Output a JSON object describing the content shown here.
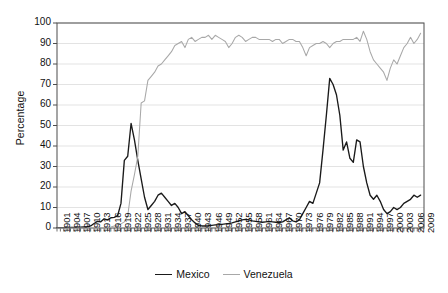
{
  "chart_data": {
    "type": "line",
    "title": "",
    "subtitle": "",
    "xlabel": "",
    "ylabel": "Percentage",
    "xlim": [
      1901,
      2010
    ],
    "ylim": [
      0,
      100
    ],
    "yticks": [
      0,
      10,
      20,
      30,
      40,
      50,
      60,
      70,
      80,
      90,
      100
    ],
    "xticks": [
      1901,
      1904,
      1907,
      1910,
      1913,
      1916,
      1919,
      1922,
      1925,
      1928,
      1931,
      1934,
      1937,
      1940,
      1943,
      1946,
      1949,
      1952,
      1955,
      1958,
      1961,
      1964,
      1967,
      1970,
      1973,
      1976,
      1979,
      1982,
      1985,
      1988,
      1991,
      1994,
      1997,
      2000,
      2003,
      2006,
      2009
    ],
    "grid": "horizontal",
    "legend_position": "bottom-center",
    "series": [
      {
        "name": "Mexico",
        "color": "#1a1a1a",
        "x": [
          1901,
          1902,
          1903,
          1904,
          1905,
          1906,
          1907,
          1908,
          1909,
          1910,
          1911,
          1912,
          1913,
          1914,
          1915,
          1916,
          1917,
          1918,
          1919,
          1920,
          1921,
          1922,
          1923,
          1924,
          1925,
          1926,
          1927,
          1928,
          1929,
          1930,
          1931,
          1932,
          1933,
          1934,
          1935,
          1936,
          1937,
          1938,
          1939,
          1940,
          1941,
          1942,
          1943,
          1944,
          1945,
          1946,
          1947,
          1948,
          1949,
          1950,
          1951,
          1952,
          1953,
          1954,
          1955,
          1956,
          1957,
          1958,
          1959,
          1960,
          1961,
          1962,
          1963,
          1964,
          1965,
          1966,
          1967,
          1968,
          1969,
          1970,
          1971,
          1972,
          1973,
          1974,
          1975,
          1976,
          1977,
          1978,
          1979,
          1980,
          1981,
          1982,
          1983,
          1984,
          1985,
          1986,
          1987,
          1988,
          1989,
          1990,
          1991,
          1992,
          1993,
          1994,
          1995,
          1996,
          1997,
          1998,
          1999,
          2000,
          2001,
          2002,
          2003,
          2004,
          2005,
          2006,
          2007,
          2008,
          2009
        ],
        "values": [
          0.2,
          0.2,
          0.2,
          0.3,
          0.3,
          0.3,
          0.4,
          0.4,
          0.5,
          0.6,
          1.0,
          2.2,
          3.2,
          3.0,
          4.5,
          4.0,
          5.0,
          5.2,
          6.0,
          12.0,
          33.0,
          35.0,
          51.0,
          43.0,
          33.0,
          24.0,
          15.0,
          9.0,
          11.0,
          13.0,
          16.0,
          17.0,
          15.0,
          13.0,
          11.0,
          12.0,
          10.0,
          7.0,
          8.0,
          6.0,
          4.0,
          2.5,
          1.2,
          1.0,
          1.0,
          1.1,
          1.3,
          1.5,
          1.6,
          1.8,
          2.0,
          2.2,
          2.5,
          3.0,
          3.5,
          4.0,
          4.2,
          4.0,
          3.5,
          3.2,
          3.0,
          2.8,
          3.0,
          3.2,
          3.0,
          2.8,
          2.6,
          3.0,
          4.0,
          5.0,
          3.5,
          3.0,
          4.0,
          7.0,
          10.0,
          13.0,
          12.0,
          17.0,
          22.0,
          38.0,
          55.0,
          73.0,
          70.0,
          65.0,
          55.0,
          38.0,
          42.0,
          34.0,
          32.0,
          43.0,
          42.0,
          30.0,
          22.0,
          16.0,
          14.0,
          16.0,
          13.0,
          9.0,
          7.0,
          8.0,
          10.0,
          9.0,
          10.0,
          12.0,
          13.0,
          14.0,
          16.0,
          15.0,
          16.0
        ]
      },
      {
        "name": "Venezuela",
        "color": "#a8a8a8",
        "x": [
          1901,
          1902,
          1903,
          1904,
          1905,
          1906,
          1907,
          1908,
          1909,
          1910,
          1911,
          1912,
          1913,
          1914,
          1915,
          1916,
          1917,
          1918,
          1919,
          1920,
          1921,
          1922,
          1923,
          1924,
          1925,
          1926,
          1927,
          1928,
          1929,
          1930,
          1931,
          1932,
          1933,
          1934,
          1935,
          1936,
          1937,
          1938,
          1939,
          1940,
          1941,
          1942,
          1943,
          1944,
          1945,
          1946,
          1947,
          1948,
          1949,
          1950,
          1951,
          1952,
          1953,
          1954,
          1955,
          1956,
          1957,
          1958,
          1959,
          1960,
          1961,
          1962,
          1963,
          1964,
          1965,
          1966,
          1967,
          1968,
          1969,
          1970,
          1971,
          1972,
          1973,
          1974,
          1975,
          1976,
          1977,
          1978,
          1979,
          1980,
          1981,
          1982,
          1983,
          1984,
          1985,
          1986,
          1987,
          1988,
          1989,
          1990,
          1991,
          1992,
          1993,
          1994,
          1995,
          1996,
          1997,
          1998,
          1999,
          2000,
          2001,
          2002,
          2003,
          2004,
          2005,
          2006,
          2007,
          2008,
          2009
        ],
        "values": [
          0,
          0,
          0,
          0,
          0,
          0,
          0,
          0,
          0,
          0,
          0,
          0,
          0,
          0,
          0,
          0.2,
          0.5,
          1.0,
          1.5,
          2.0,
          3.0,
          6.0,
          18.0,
          26.0,
          35.0,
          61.0,
          62.0,
          72.0,
          74.0,
          76.0,
          79.0,
          80.0,
          82.0,
          84.0,
          86.0,
          89.0,
          90.0,
          91.0,
          88.0,
          92.0,
          93.0,
          91.0,
          92.0,
          93.0,
          93.0,
          94.0,
          92.0,
          94.0,
          93.0,
          92.0,
          91.0,
          88.0,
          90.0,
          93.0,
          94.0,
          93.0,
          91.0,
          92.0,
          93.0,
          93.0,
          92.0,
          92.0,
          92.0,
          92.0,
          91.0,
          92.0,
          92.0,
          90.0,
          91.0,
          92.0,
          92.0,
          91.0,
          91.0,
          88.0,
          84.0,
          88.0,
          89.0,
          90.0,
          90.0,
          91.0,
          90.0,
          88.0,
          90.0,
          91.0,
          91.0,
          92.0,
          92.0,
          92.0,
          92.0,
          93.0,
          91.0,
          96.0,
          92.0,
          86.0,
          82.0,
          80.0,
          78.0,
          76.0,
          72.0,
          78.0,
          82.0,
          80.0,
          84.0,
          88.0,
          90.0,
          93.0,
          90.0,
          92.0,
          95.0
        ]
      }
    ]
  },
  "legend": {
    "items": [
      {
        "label": "Mexico",
        "color": "#1a1a1a"
      },
      {
        "label": "Venezuela",
        "color": "#a8a8a8"
      }
    ]
  },
  "axes": {
    "y_title": "Percentage"
  },
  "style": {
    "grid_color": "#e3e3e3",
    "axis_color": "#4d4d4d",
    "background": "#ffffff"
  }
}
